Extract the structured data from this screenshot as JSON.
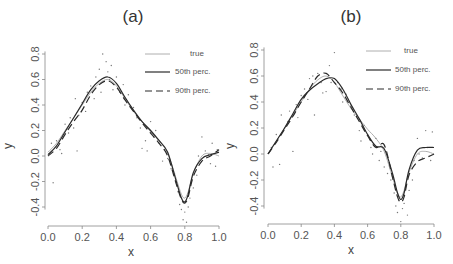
{
  "chart_data": [
    {
      "type": "line",
      "panel": "a",
      "title": "(a)",
      "xlabel": "x",
      "ylabel": "y",
      "xlim": [
        0.0,
        1.0
      ],
      "ylim": [
        -0.55,
        0.85
      ],
      "xticks": [
        "0.0",
        "0.2",
        "0.4",
        "0.6",
        "0.8",
        "1.0"
      ],
      "yticks": [
        "-0.4",
        "-0.2",
        "0.0",
        "0.2",
        "0.4",
        "0.6",
        "0.8"
      ],
      "grid": false,
      "legend_position": "upper right",
      "legend": [
        "true",
        "50th perc.",
        "90th perc."
      ],
      "series": [
        {
          "name": "true",
          "style": "thin-gray",
          "x": [
            0.0,
            0.05,
            0.1,
            0.15,
            0.2,
            0.25,
            0.3,
            0.35,
            0.4,
            0.45,
            0.5,
            0.55,
            0.6,
            0.65,
            0.7,
            0.75,
            0.78,
            0.8,
            0.82,
            0.85,
            0.9,
            0.95,
            1.0
          ],
          "y": [
            0.03,
            0.1,
            0.2,
            0.3,
            0.4,
            0.5,
            0.57,
            0.6,
            0.55,
            0.45,
            0.35,
            0.27,
            0.19,
            0.12,
            0.02,
            -0.18,
            -0.3,
            -0.33,
            -0.28,
            -0.14,
            0.0,
            0.02,
            0.0
          ]
        },
        {
          "name": "50th perc.",
          "style": "solid-dark",
          "x": [
            0.0,
            0.05,
            0.1,
            0.15,
            0.2,
            0.25,
            0.3,
            0.35,
            0.4,
            0.45,
            0.5,
            0.55,
            0.6,
            0.65,
            0.7,
            0.75,
            0.78,
            0.8,
            0.82,
            0.85,
            0.9,
            0.95,
            1.0
          ],
          "y": [
            0.01,
            0.08,
            0.19,
            0.3,
            0.41,
            0.52,
            0.59,
            0.62,
            0.57,
            0.46,
            0.36,
            0.27,
            0.2,
            0.12,
            0.03,
            -0.2,
            -0.33,
            -0.36,
            -0.3,
            -0.13,
            -0.02,
            0.01,
            0.03
          ]
        },
        {
          "name": "90th perc.",
          "style": "dashed-dark",
          "x": [
            0.0,
            0.05,
            0.1,
            0.15,
            0.2,
            0.25,
            0.3,
            0.35,
            0.4,
            0.45,
            0.5,
            0.55,
            0.6,
            0.65,
            0.7,
            0.75,
            0.78,
            0.8,
            0.82,
            0.85,
            0.9,
            0.95,
            1.0
          ],
          "y": [
            0.0,
            0.06,
            0.17,
            0.27,
            0.36,
            0.48,
            0.56,
            0.59,
            0.54,
            0.44,
            0.35,
            0.26,
            0.18,
            0.1,
            0.0,
            -0.22,
            -0.34,
            -0.37,
            -0.32,
            -0.16,
            -0.04,
            0.0,
            0.05
          ]
        }
      ],
      "scatter_points": [
        [
          0.02,
          0.1
        ],
        [
          0.03,
          -0.21
        ],
        [
          0.05,
          0.12
        ],
        [
          0.07,
          0.05
        ],
        [
          0.08,
          0.02
        ],
        [
          0.1,
          0.25
        ],
        [
          0.12,
          0.18
        ],
        [
          0.13,
          0.3
        ],
        [
          0.15,
          0.22
        ],
        [
          0.16,
          0.45
        ],
        [
          0.17,
          0.04
        ],
        [
          0.18,
          0.32
        ],
        [
          0.2,
          0.42
        ],
        [
          0.22,
          0.35
        ],
        [
          0.23,
          0.5
        ],
        [
          0.25,
          0.55
        ],
        [
          0.27,
          0.45
        ],
        [
          0.28,
          0.62
        ],
        [
          0.3,
          0.68
        ],
        [
          0.31,
          0.5
        ],
        [
          0.32,
          0.8
        ],
        [
          0.34,
          0.74
        ],
        [
          0.35,
          0.66
        ],
        [
          0.36,
          0.6
        ],
        [
          0.37,
          0.71
        ],
        [
          0.38,
          0.52
        ],
        [
          0.4,
          0.62
        ],
        [
          0.42,
          0.5
        ],
        [
          0.44,
          0.56
        ],
        [
          0.45,
          0.4
        ],
        [
          0.47,
          0.48
        ],
        [
          0.5,
          0.38
        ],
        [
          0.52,
          0.3
        ],
        [
          0.54,
          0.22
        ],
        [
          0.55,
          0.06
        ],
        [
          0.57,
          0.12
        ],
        [
          0.58,
          0.04
        ],
        [
          0.6,
          0.27
        ],
        [
          0.62,
          0.15
        ],
        [
          0.63,
          0.2
        ],
        [
          0.65,
          0.1
        ],
        [
          0.67,
          -0.04
        ],
        [
          0.68,
          0.05
        ],
        [
          0.7,
          -0.02
        ],
        [
          0.72,
          -0.1
        ],
        [
          0.74,
          -0.14
        ],
        [
          0.76,
          -0.28
        ],
        [
          0.77,
          -0.38
        ],
        [
          0.78,
          -0.42
        ],
        [
          0.79,
          -0.5
        ],
        [
          0.8,
          -0.44
        ],
        [
          0.81,
          -0.52
        ],
        [
          0.82,
          -0.4
        ],
        [
          0.83,
          -0.33
        ],
        [
          0.85,
          -0.25
        ],
        [
          0.87,
          -0.15
        ],
        [
          0.88,
          0.0
        ],
        [
          0.9,
          0.15
        ],
        [
          0.92,
          0.04
        ],
        [
          0.94,
          0.01
        ],
        [
          0.95,
          -0.06
        ],
        [
          0.96,
          0.1
        ],
        [
          0.98,
          -0.08
        ],
        [
          0.99,
          0.05
        ]
      ]
    },
    {
      "type": "line",
      "panel": "b",
      "title": "(b)",
      "xlabel": "x",
      "ylabel": "y",
      "xlim": [
        0.0,
        1.0
      ],
      "ylim": [
        -0.55,
        0.85
      ],
      "xticks": [
        "0.0",
        "0.2",
        "0.4",
        "0.6",
        "0.8",
        "1.0"
      ],
      "yticks": [
        "-0.4",
        "-0.2",
        "0.0",
        "0.2",
        "0.4",
        "0.6",
        "0.8"
      ],
      "grid": false,
      "legend_position": "upper right",
      "legend": [
        "true",
        "50th perc.",
        "90th perc."
      ],
      "series": [
        {
          "name": "true",
          "style": "thin-gray",
          "x": [
            0.0,
            0.05,
            0.1,
            0.15,
            0.2,
            0.25,
            0.3,
            0.35,
            0.4,
            0.45,
            0.5,
            0.55,
            0.6,
            0.65,
            0.7,
            0.75,
            0.78,
            0.8,
            0.82,
            0.85,
            0.9,
            0.95,
            1.0
          ],
          "y": [
            0.0,
            0.1,
            0.2,
            0.3,
            0.4,
            0.5,
            0.57,
            0.6,
            0.55,
            0.45,
            0.35,
            0.27,
            0.19,
            0.12,
            0.02,
            -0.18,
            -0.3,
            -0.33,
            -0.28,
            -0.14,
            0.0,
            0.02,
            0.0
          ]
        },
        {
          "name": "50th perc.",
          "style": "solid-dark",
          "x": [
            0.0,
            0.05,
            0.1,
            0.15,
            0.2,
            0.25,
            0.3,
            0.35,
            0.4,
            0.45,
            0.5,
            0.55,
            0.6,
            0.65,
            0.7,
            0.75,
            0.78,
            0.8,
            0.82,
            0.85,
            0.9,
            0.95,
            1.0
          ],
          "y": [
            0.0,
            0.1,
            0.2,
            0.31,
            0.42,
            0.49,
            0.54,
            0.58,
            0.58,
            0.5,
            0.38,
            0.27,
            0.15,
            0.06,
            0.04,
            -0.15,
            -0.3,
            -0.35,
            -0.3,
            -0.12,
            0.03,
            0.05,
            0.05
          ]
        },
        {
          "name": "90th perc.",
          "style": "dashed-dark",
          "x": [
            0.0,
            0.05,
            0.1,
            0.15,
            0.2,
            0.25,
            0.3,
            0.35,
            0.4,
            0.45,
            0.5,
            0.55,
            0.6,
            0.65,
            0.7,
            0.75,
            0.78,
            0.8,
            0.82,
            0.85,
            0.9,
            0.95,
            1.0
          ],
          "y": [
            0.0,
            0.09,
            0.19,
            0.29,
            0.4,
            0.5,
            0.6,
            0.62,
            0.55,
            0.47,
            0.36,
            0.25,
            0.14,
            0.05,
            0.07,
            -0.18,
            -0.33,
            -0.37,
            -0.33,
            -0.16,
            -0.06,
            -0.03,
            0.0
          ]
        }
      ],
      "scatter_points": [
        [
          0.02,
          0.05
        ],
        [
          0.03,
          -0.1
        ],
        [
          0.05,
          0.15
        ],
        [
          0.07,
          -0.08
        ],
        [
          0.08,
          0.3
        ],
        [
          0.1,
          0.2
        ],
        [
          0.12,
          0.25
        ],
        [
          0.13,
          0.33
        ],
        [
          0.15,
          0.02
        ],
        [
          0.17,
          0.38
        ],
        [
          0.18,
          0.28
        ],
        [
          0.2,
          0.45
        ],
        [
          0.22,
          0.5
        ],
        [
          0.24,
          0.42
        ],
        [
          0.25,
          0.58
        ],
        [
          0.27,
          0.6
        ],
        [
          0.28,
          0.3
        ],
        [
          0.3,
          0.62
        ],
        [
          0.32,
          0.55
        ],
        [
          0.33,
          0.47
        ],
        [
          0.35,
          0.48
        ],
        [
          0.37,
          0.68
        ],
        [
          0.38,
          0.55
        ],
        [
          0.4,
          0.78
        ],
        [
          0.42,
          0.55
        ],
        [
          0.44,
          0.5
        ],
        [
          0.45,
          0.4
        ],
        [
          0.47,
          0.46
        ],
        [
          0.5,
          0.37
        ],
        [
          0.52,
          0.3
        ],
        [
          0.55,
          0.18
        ],
        [
          0.56,
          0.1
        ],
        [
          0.58,
          0.22
        ],
        [
          0.6,
          0.15
        ],
        [
          0.62,
          0.05
        ],
        [
          0.63,
          0.0
        ],
        [
          0.65,
          0.12
        ],
        [
          0.67,
          -0.05
        ],
        [
          0.68,
          0.02
        ],
        [
          0.7,
          -0.1
        ],
        [
          0.72,
          -0.15
        ],
        [
          0.74,
          -0.2
        ],
        [
          0.76,
          -0.3
        ],
        [
          0.77,
          -0.4
        ],
        [
          0.78,
          -0.45
        ],
        [
          0.79,
          -0.36
        ],
        [
          0.8,
          -0.52
        ],
        [
          0.81,
          -0.42
        ],
        [
          0.82,
          -0.38
        ],
        [
          0.84,
          -0.47
        ],
        [
          0.85,
          -0.28
        ],
        [
          0.87,
          -0.2
        ],
        [
          0.88,
          -0.05
        ],
        [
          0.9,
          0.12
        ],
        [
          0.91,
          0.0
        ],
        [
          0.93,
          -0.03
        ],
        [
          0.95,
          0.18
        ],
        [
          0.96,
          0.05
        ],
        [
          0.98,
          -0.05
        ],
        [
          0.99,
          0.17
        ]
      ]
    }
  ],
  "panels": [
    {
      "title": "(a)",
      "xlabel": "x",
      "ylabel": "y",
      "legend": {
        "true": "true",
        "p50": "50th perc.",
        "p90": "90th perc."
      }
    },
    {
      "title": "(b)",
      "xlabel": "x",
      "ylabel": "y",
      "legend": {
        "true": "true",
        "p50": "50th perc.",
        "p90": "90th perc."
      }
    }
  ],
  "colors": {
    "true": "#9a9a9a",
    "p50": "#2a2a2a",
    "p90": "#2a2a2a",
    "points": "#777777",
    "axis": "#888888"
  }
}
